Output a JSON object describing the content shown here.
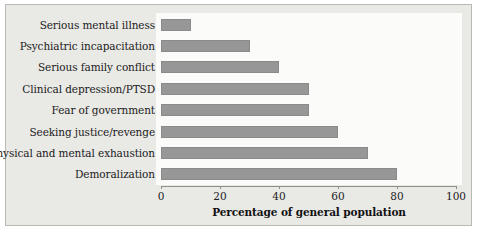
{
  "chart_data": {
    "type": "bar",
    "orientation": "horizontal",
    "title": "",
    "xlabel": "Percentage of general population",
    "ylabel": "",
    "xlim": [
      0,
      100
    ],
    "xticks": [
      0,
      20,
      40,
      60,
      80,
      100
    ],
    "xtick_labels": [
      "0",
      "20",
      "40",
      "60",
      "80",
      "100"
    ],
    "grid": false,
    "legend": null,
    "bar_color": "#979797",
    "categories": [
      "Serious mental illness",
      "Psychiatric incapacitation",
      "Serious family conflict",
      "Clinical depression/PTSD",
      "Fear of government",
      "Seeking justice/revenge",
      "Physical and mental exhaustion",
      "Demoralization"
    ],
    "values": [
      10,
      30,
      40,
      50,
      50,
      60,
      70,
      80
    ]
  },
  "figure": {
    "background_color": "#e9e9e6",
    "plot_background_color": "#fbfbfa",
    "border_color": "#b9b9b4"
  }
}
